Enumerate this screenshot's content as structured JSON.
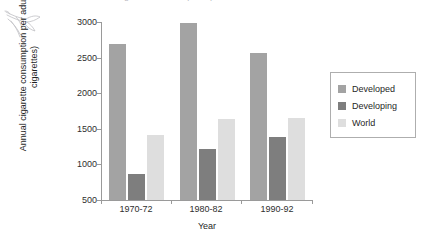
{
  "clipped_title": "Annual cigarette consumption per adult",
  "decoration": {
    "sketch_name": "hand-drawn-sketch"
  },
  "chart_data": {
    "type": "bar",
    "title": "Annual cigarette consumption per adult",
    "xlabel": "Year",
    "ylabel": "Annual cigarette consumption per adult (in cigarettes)",
    "categories": [
      "1970-72",
      "1980-82",
      "1990-92"
    ],
    "series": [
      {
        "name": "Developed",
        "color": "#a3a3a3",
        "values": [
          2690,
          2980,
          2570
        ]
      },
      {
        "name": "Developing",
        "color": "#7e7e7e",
        "values": [
          870,
          1210,
          1390
        ]
      },
      {
        "name": "World",
        "color": "#dedede",
        "values": [
          1410,
          1640,
          1650
        ]
      }
    ],
    "ylim": [
      500,
      3000
    ],
    "yticks": [
      3000,
      2500,
      2000,
      1500,
      1000,
      500
    ],
    "ytick_labels": [
      "3000",
      "2500",
      "2000",
      "1500",
      "1000",
      "500"
    ],
    "grid": false,
    "legend_position": "right"
  },
  "legend": {
    "entries": [
      {
        "label": "Developed",
        "color": "#a3a3a3"
      },
      {
        "label": "Developing",
        "color": "#7e7e7e"
      },
      {
        "label": "World",
        "color": "#dedede"
      }
    ]
  },
  "axis_titles": {
    "y": "Annual cigarette consumption per adult (in cigarettes)",
    "x": "Year"
  }
}
